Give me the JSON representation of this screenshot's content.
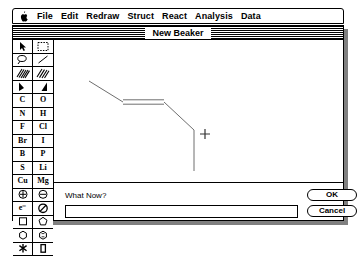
{
  "menubar": {
    "apple_icon": "apple-logo",
    "items": [
      {
        "label": "File"
      },
      {
        "label": "Edit"
      },
      {
        "label": "Redraw"
      },
      {
        "label": "Struct"
      },
      {
        "label": "React"
      },
      {
        "label": "Analysis"
      },
      {
        "label": "Data"
      }
    ]
  },
  "window": {
    "title": "New Beaker"
  },
  "palette": {
    "rows": [
      {
        "cells": [
          {
            "name": "pointer-tool-icon",
            "kind": "icon",
            "icon": "arrow-pointer",
            "selected": false
          },
          {
            "name": "marquee-tool-icon",
            "kind": "icon",
            "icon": "dashed-marquee",
            "selected": false
          }
        ]
      },
      {
        "cells": [
          {
            "name": "lasso-tool-icon",
            "kind": "icon",
            "icon": "lasso",
            "selected": false
          },
          {
            "name": "bond-tool-icon",
            "kind": "icon",
            "icon": "plain-bond",
            "selected": false
          }
        ]
      },
      {
        "cells": [
          {
            "name": "hashed-bond-tool-icon",
            "kind": "icon",
            "icon": "hash-bond-left",
            "selected": false
          },
          {
            "name": "hashed-bond-alt-tool-icon",
            "kind": "icon",
            "icon": "hash-bond-right",
            "selected": false
          }
        ]
      },
      {
        "cells": [
          {
            "name": "wedge-bond-tool-icon",
            "kind": "icon",
            "icon": "wedge-left",
            "selected": false
          },
          {
            "name": "wedge-bond-alt-tool-icon",
            "kind": "icon",
            "icon": "wedge-right",
            "selected": false
          }
        ]
      },
      {
        "cells": [
          {
            "name": "element-carbon-button",
            "kind": "text",
            "label": "C"
          },
          {
            "name": "element-oxygen-button",
            "kind": "text",
            "label": "O"
          }
        ]
      },
      {
        "cells": [
          {
            "name": "element-nitrogen-button",
            "kind": "text",
            "label": "N"
          },
          {
            "name": "element-hydrogen-button",
            "kind": "text",
            "label": "H"
          }
        ]
      },
      {
        "cells": [
          {
            "name": "element-fluorine-button",
            "kind": "text",
            "label": "F"
          },
          {
            "name": "element-chlorine-button",
            "kind": "text",
            "label": "Cl"
          }
        ]
      },
      {
        "cells": [
          {
            "name": "element-bromine-button",
            "kind": "text",
            "label": "Br"
          },
          {
            "name": "element-iodine-button",
            "kind": "text",
            "label": "I"
          }
        ]
      },
      {
        "cells": [
          {
            "name": "element-boron-button",
            "kind": "text",
            "label": "B"
          },
          {
            "name": "element-phosphorus-button",
            "kind": "text",
            "label": "P"
          }
        ]
      },
      {
        "cells": [
          {
            "name": "element-sulfur-button",
            "kind": "text",
            "label": "S"
          },
          {
            "name": "element-lithium-button",
            "kind": "text",
            "label": "Li"
          }
        ]
      },
      {
        "cells": [
          {
            "name": "element-copper-button",
            "kind": "text",
            "label": "Cu"
          },
          {
            "name": "element-magnesium-button",
            "kind": "text",
            "label": "Mg"
          }
        ]
      },
      {
        "cells": [
          {
            "name": "positive-charge-tool-icon",
            "kind": "icon",
            "icon": "circle-plus"
          },
          {
            "name": "negative-charge-tool-icon",
            "kind": "icon",
            "icon": "circle-minus"
          }
        ]
      },
      {
        "cells": [
          {
            "name": "electron-tool-button",
            "kind": "text",
            "label": "e⁻"
          },
          {
            "name": "no-charge-tool-icon",
            "kind": "icon",
            "icon": "circle-slash"
          }
        ]
      },
      {
        "cells": [
          {
            "name": "square-ring-tool-icon",
            "kind": "icon",
            "icon": "square-ring"
          },
          {
            "name": "pentagon-ring-tool-icon",
            "kind": "icon",
            "icon": "pentagon-ring"
          }
        ]
      },
      {
        "cells": [
          {
            "name": "hexagon-ring-tool-icon",
            "kind": "icon",
            "icon": "hexagon-ring"
          },
          {
            "name": "hexagon-ring-aromatic-tool-icon",
            "kind": "icon",
            "icon": "hexagon-ring-aromatic"
          }
        ]
      },
      {
        "cells": [
          {
            "name": "asterisk-tool-icon",
            "kind": "icon",
            "icon": "asterisk",
            "selected": false
          },
          {
            "name": "rectangle-tool-icon",
            "kind": "icon",
            "icon": "filled-rectangle",
            "selected": false
          }
        ]
      }
    ]
  },
  "canvas": {
    "cursor": {
      "name": "crosshair-cursor",
      "x": 151,
      "y": 94
    },
    "structure": {
      "name": "molecule-skeleton",
      "vertices": [
        {
          "x": 35,
          "y": 41
        },
        {
          "x": 69,
          "y": 62
        },
        {
          "x": 110,
          "y": 62
        },
        {
          "x": 140,
          "y": 90
        },
        {
          "x": 140,
          "y": 131
        }
      ],
      "bonds": [
        {
          "from": 0,
          "to": 1,
          "order": 1
        },
        {
          "from": 1,
          "to": 2,
          "order": 2
        },
        {
          "from": 2,
          "to": 3,
          "order": 1
        },
        {
          "from": 3,
          "to": 4,
          "order": 1
        }
      ]
    }
  },
  "dialog": {
    "prompt": "What Now?",
    "input_value": "",
    "input_placeholder": "",
    "ok_label": "OK",
    "cancel_label": "Cancel"
  },
  "colors": {
    "ink": "#000000",
    "paper": "#ffffff",
    "shadow": "#808080",
    "bond": "#6e6e6e"
  }
}
